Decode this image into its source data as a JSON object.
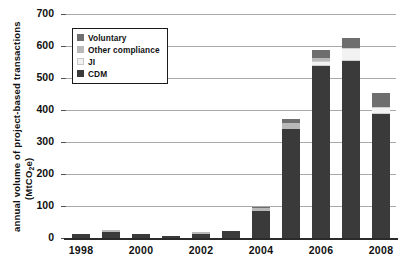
{
  "chart_data": {
    "type": "bar",
    "title": "",
    "subtitle": "",
    "stacked": true,
    "xlabel": "",
    "ylabel": "annual volume of project-based transactions (MtCO2e)",
    "ylabel_line1": "annual volume of project-based transactions",
    "ylabel_line2_pre": "(MtCO",
    "ylabel_line2_sub": "2",
    "ylabel_line2_post": "e)",
    "ylim": [
      0,
      700
    ],
    "ytick_step": 100,
    "yticks": [
      "0",
      "100",
      "200",
      "300",
      "400",
      "500",
      "600",
      "700"
    ],
    "grid": true,
    "grid_axis": "y",
    "legend_position": "upper-left-inside",
    "categories": [
      "1998",
      "1999",
      "2000",
      "2001",
      "2002",
      "2003",
      "2004",
      "2005",
      "2006",
      "2007",
      "2008"
    ],
    "xtick_labels_shown": [
      "1998",
      "2000",
      "2002",
      "2004",
      "2006",
      "2008"
    ],
    "series": [
      {
        "name": "CDM",
        "color": "#3a3a3a",
        "values": [
          12,
          20,
          11,
          7,
          14,
          23,
          85,
          341,
          537,
          552,
          389
        ]
      },
      {
        "name": "JI",
        "color": "#f2f2f2",
        "values": [
          0,
          0,
          0,
          0,
          0,
          0,
          0,
          0,
          16,
          41,
          20
        ]
      },
      {
        "name": "Other compliance",
        "color": "#b9b9b9",
        "values": [
          0,
          6,
          0,
          0,
          6,
          0,
          9,
          17,
          10,
          0,
          0
        ]
      },
      {
        "name": "Voluntary",
        "color": "#6e6e6e",
        "values": [
          0,
          0,
          0,
          0,
          0,
          0,
          4,
          14,
          24,
          33,
          43
        ]
      }
    ],
    "totals": [
      12,
      26,
      11,
      7,
      20,
      23,
      98,
      372,
      587,
      626,
      452
    ],
    "annotations": []
  },
  "legend": {
    "items": [
      {
        "label": "Voluntary",
        "swatch": "vol",
        "swatch_name": "legend-swatch-voluntary"
      },
      {
        "label": "Other compliance",
        "swatch": "other",
        "swatch_name": "legend-swatch-other-compliance"
      },
      {
        "label": "JI",
        "swatch": "ji",
        "swatch_name": "legend-swatch-ji"
      },
      {
        "label": "CDM",
        "swatch": "cdm",
        "swatch_name": "legend-swatch-cdm"
      }
    ]
  },
  "colors": {
    "cdm": "#3a3a3a",
    "ji": "#f2f2f2",
    "other_compliance": "#b9b9b9",
    "voluntary": "#6e6e6e",
    "gridline": "#a8a8a8",
    "axis": "#2b2b2b",
    "background": "#ffffff"
  }
}
